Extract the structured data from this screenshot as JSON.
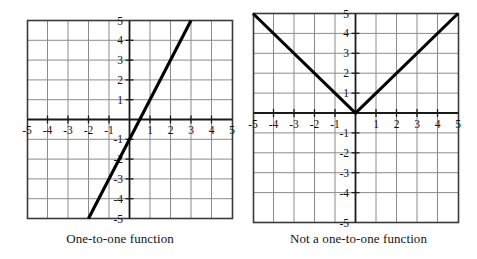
{
  "figure": {
    "title": "",
    "background_color": "#ffffff",
    "line_color": "#000000",
    "grid_color": "#8c8c8c",
    "axis_color": "#1a1a1a"
  },
  "panels": [
    {
      "id": "left",
      "caption": "One-to-one function",
      "x_ticks": [
        "-5",
        "-4",
        "-3",
        "-2",
        "-1",
        "1",
        "2",
        "3",
        "4",
        "5"
      ],
      "y_ticks": [
        "5",
        "4",
        "3",
        "2",
        "1",
        "-1",
        "-2",
        "-3",
        "-4",
        "-5"
      ]
    },
    {
      "id": "right",
      "caption": "Not a one-to-one function",
      "x_ticks": [
        "-5",
        "-4",
        "-3",
        "-2",
        "-1",
        "1",
        "2",
        "3",
        "4",
        "5"
      ],
      "y_ticks": [
        "5",
        "4",
        "3",
        "2",
        "1",
        "-1",
        "-2",
        "-3",
        "-4",
        "-5"
      ]
    }
  ],
  "chart_data": [
    {
      "type": "line",
      "panel": "left",
      "title": "One-to-one function",
      "xlabel": "",
      "ylabel": "",
      "xlim": [
        -5,
        5
      ],
      "ylim": [
        -5,
        5
      ],
      "grid": true,
      "xticks": [
        -5,
        -4,
        -3,
        -2,
        -1,
        1,
        2,
        3,
        4,
        5
      ],
      "yticks": [
        -5,
        -4,
        -3,
        -2,
        -1,
        1,
        2,
        3,
        4,
        5
      ],
      "legend": "none",
      "series": [
        {
          "name": "y = 2x - 1",
          "equation": "y = 2x - 1",
          "x": [
            -2,
            3
          ],
          "y": [
            -5,
            5
          ]
        }
      ]
    },
    {
      "type": "line",
      "panel": "right",
      "title": "Not a one-to-one function",
      "xlabel": "",
      "ylabel": "",
      "xlim": [
        -5,
        5
      ],
      "ylim": [
        -5,
        5
      ],
      "grid": true,
      "xticks": [
        -5,
        -4,
        -3,
        -2,
        -1,
        1,
        2,
        3,
        4,
        5
      ],
      "yticks": [
        -5,
        -4,
        -3,
        -2,
        -1,
        1,
        2,
        3,
        4,
        5
      ],
      "legend": "none",
      "series": [
        {
          "name": "y = |x|",
          "equation": "y = |x|",
          "x": [
            -5,
            0,
            5
          ],
          "y": [
            5,
            0,
            5
          ]
        }
      ]
    }
  ]
}
